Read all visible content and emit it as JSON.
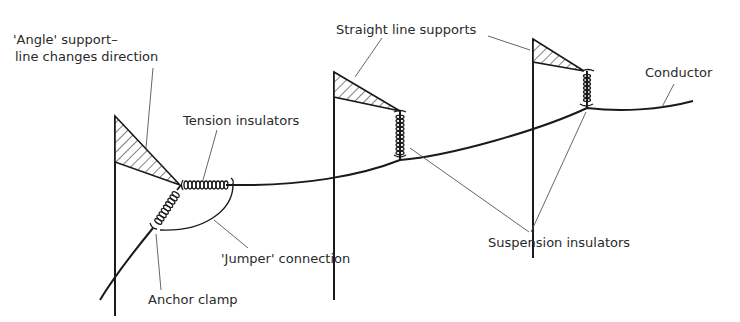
{
  "diagram": {
    "colors": {
      "line": "#1a1a1a",
      "leader": "#555555",
      "text": "#2a2a2a",
      "background": "#ffffff"
    },
    "labels": {
      "angle_support_line1": "'Angle' support–",
      "angle_support_line2": "line changes direction",
      "tension_insulators": "Tension insulators",
      "straight_line_supports": "Straight line supports",
      "conductor": "Conductor",
      "jumper_connection": "'Jumper' connection",
      "suspension_insulators": "Suspension insulators",
      "anchor_clamp": "Anchor clamp"
    },
    "components": [
      {
        "id": "angle-support",
        "type": "pole-with-crossarm"
      },
      {
        "id": "straight-support-1",
        "type": "pole-with-crossarm"
      },
      {
        "id": "straight-support-2",
        "type": "pole-with-crossarm"
      },
      {
        "id": "tension-insulator-string",
        "type": "insulator"
      },
      {
        "id": "anchor-insulator-string",
        "type": "insulator"
      },
      {
        "id": "suspension-insulator-1",
        "type": "insulator"
      },
      {
        "id": "suspension-insulator-2",
        "type": "insulator"
      },
      {
        "id": "jumper",
        "type": "connection"
      },
      {
        "id": "conductor",
        "type": "wire"
      }
    ]
  }
}
